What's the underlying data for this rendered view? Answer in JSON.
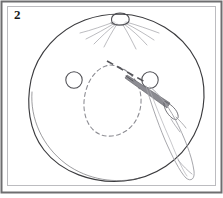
{
  "figure": {
    "step_label": "2",
    "caption": "",
    "colors": {
      "background": "#ffffff",
      "outer_frame": "#6e6e70",
      "inner_frame": "#b9b9bc",
      "main_outline": "#3b3b3e",
      "fine_line": "#8a8a8e",
      "dashed_line": "#909095",
      "thread": "#a0a0a6",
      "needle": "#6a6a70",
      "label_text": "#1a1a1a"
    },
    "frames": {
      "outer": {
        "x": 1,
        "y": 1,
        "width": 221,
        "height": 192,
        "stroke_width": 2
      },
      "inner": {
        "x": 7,
        "y": 6,
        "width": 209,
        "height": 180,
        "stroke_width": 1
      }
    },
    "elements": {
      "fabric_circle": {
        "name": "fabric-circle",
        "description": "Large irregular circle of fabric",
        "center_x": 116,
        "center_y": 103,
        "radius_x": 87,
        "radius_y": 79
      },
      "gathering_knot": {
        "name": "gathering-knot",
        "description": "Small knot loop at top of fabric circle",
        "center_x": 120,
        "center_y": 19,
        "radius_x": 8,
        "radius_y": 5
      },
      "gather_lines_count": 8,
      "eyelet_left": {
        "name": "eyelet-left",
        "center_x": 74,
        "center_y": 80,
        "radius": 8
      },
      "eyelet_right": {
        "name": "eyelet-right",
        "center_x": 150,
        "center_y": 80,
        "radius": 8
      },
      "fold_circle_dashed": {
        "name": "fold-circle-dashed",
        "description": "Dashed inner circle marking fold line",
        "center_x": 112,
        "center_y": 100,
        "radius_x": 28,
        "radius_y": 35,
        "dash_pattern": "4 3"
      },
      "guide_dash_line": {
        "name": "guide-dash-line",
        "description": "Heavy dashed pointer from fold circle to needle",
        "x1": 108,
        "y1": 62,
        "x2": 145,
        "y2": 82,
        "dash_pattern": "6 4"
      },
      "needle": {
        "name": "sewing-needle",
        "description": "Needle angled up-left with eye at lower right",
        "tip_x": 129,
        "tip_y": 76,
        "eye_x": 172,
        "eye_y": 106
      },
      "thread_loop": {
        "name": "thread-loop",
        "description": "Long thread loop trailing to lower right",
        "top_x": 160,
        "top_y": 92,
        "bottom_x": 186,
        "bottom_y": 180
      }
    }
  }
}
